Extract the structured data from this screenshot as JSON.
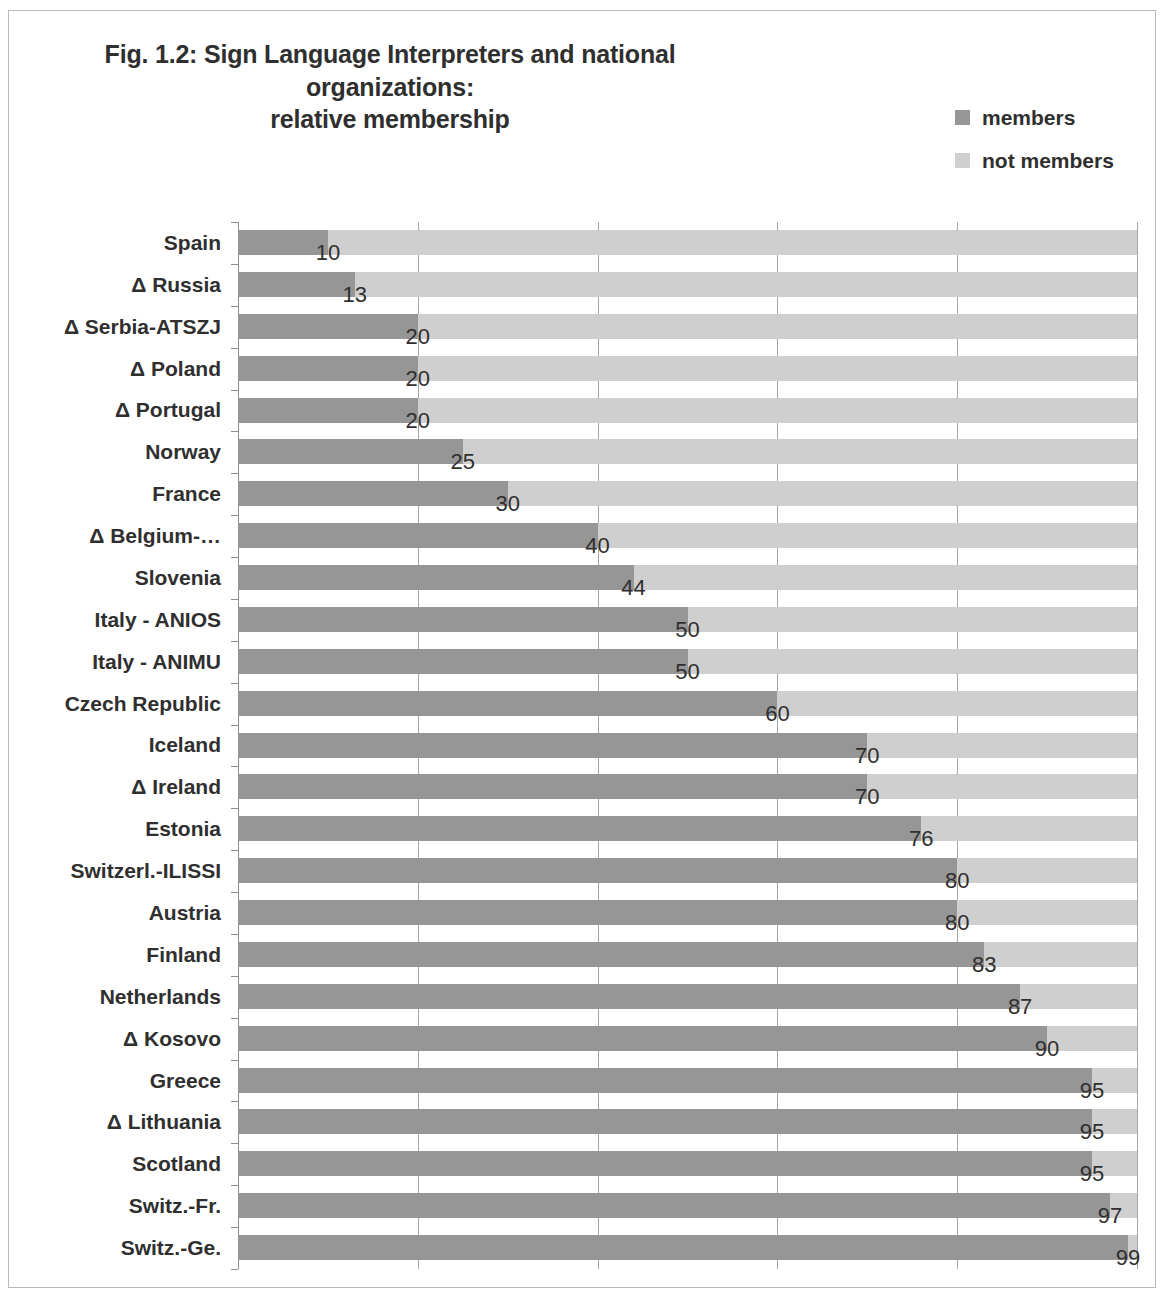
{
  "title": {
    "line1": "Fig. 1.2: Sign Language Interpreters and national organizations:",
    "line2": "relative membership"
  },
  "legend": {
    "items": [
      {
        "label": "members",
        "color": "#969696",
        "swatch_name": "legend-swatch-members"
      },
      {
        "label": "not members",
        "color": "#cfcfcf",
        "swatch_name": "legend-swatch-not-members"
      }
    ]
  },
  "colors": {
    "members": "#969696",
    "not_members": "#cfcfcf",
    "gridline": "#a6a6a6",
    "axis": "#8d8d8d",
    "text": "#2f2f2f",
    "frame": "#b9b9b9",
    "background": "#ffffff"
  },
  "chart_data": {
    "type": "bar",
    "orientation": "horizontal",
    "stacked": true,
    "percent": true,
    "title": "Fig. 1.2: Sign Language Interpreters and national organizations: relative membership",
    "xlabel": "",
    "ylabel": "",
    "xlim": [
      0,
      100
    ],
    "xticks": [
      0,
      20,
      40,
      60,
      80,
      100
    ],
    "xtick_labels": [
      "",
      "",
      "",
      "",
      "",
      ""
    ],
    "grid": true,
    "legend_position": "top-right",
    "categories": [
      "Spain",
      "Δ Russia",
      "Δ Serbia-ATSZJ",
      "Δ Poland",
      "Δ Portugal",
      "Norway",
      "France",
      "Δ  Belgium-…",
      "Slovenia",
      "Italy - ANIOS",
      "Italy - ANIMU",
      "Czech Republic",
      "Iceland",
      "Δ  Ireland",
      "Estonia",
      "Switzerl.-ILISSI",
      "Austria",
      "Finland",
      "Netherlands",
      "Δ  Kosovo",
      "Greece",
      "Δ  Lithuania",
      "Scotland",
      "Switz.-Fr.",
      "Switz.-Ge."
    ],
    "series": [
      {
        "name": "members",
        "color": "#969696",
        "values": [
          10,
          13,
          20,
          20,
          20,
          25,
          30,
          40,
          44,
          50,
          50,
          60,
          70,
          70,
          76,
          80,
          80,
          83,
          87,
          90,
          95,
          95,
          95,
          97,
          99
        ]
      },
      {
        "name": "not members",
        "color": "#cfcfcf",
        "values": [
          90,
          87,
          80,
          80,
          80,
          75,
          70,
          60,
          56,
          50,
          50,
          40,
          30,
          30,
          24,
          20,
          20,
          17,
          13,
          10,
          5,
          5,
          5,
          3,
          1
        ]
      }
    ],
    "data_labels": [
      "10",
      "13",
      "20",
      "20",
      "20",
      "25",
      "30",
      "40",
      "44",
      "50",
      "50",
      "60",
      "70",
      "70",
      "76",
      "80",
      "80",
      "83",
      "87",
      "90",
      "95",
      "95",
      "95",
      "97",
      "99"
    ]
  }
}
